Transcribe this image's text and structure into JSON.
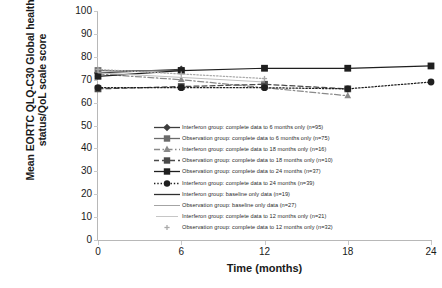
{
  "chart_data": {
    "type": "line",
    "title": "",
    "xlabel": "Time (months)",
    "ylabel": "Mean EORTC QLQ-C30 Global health status/QoL scale score",
    "x": [
      0,
      6,
      12,
      18,
      24
    ],
    "xticks": [
      "0",
      "6",
      "12",
      "18",
      "24"
    ],
    "yticks": [
      "0",
      "10",
      "20",
      "30",
      "40",
      "50",
      "60",
      "70",
      "80",
      "90",
      "100"
    ],
    "xlim": [
      0,
      24
    ],
    "ylim": [
      0,
      100
    ],
    "grid": false,
    "legend_position": "inside-lower-right",
    "series": [
      {
        "name": "Interferon group: complete data to 6 months only (n=95)",
        "marker": "diamond",
        "dash": "solid",
        "color": "#3d3d3d",
        "x": [
          0,
          6
        ],
        "values": [
          73.0,
          74.5
        ]
      },
      {
        "name": "Observation group: complete data to 6 months only (n=75)",
        "marker": "square",
        "dash": "solid",
        "color": "#6b6b6b",
        "x": [
          0,
          6
        ],
        "values": [
          74.0,
          74.0
        ]
      },
      {
        "name": "Interferon group: complete data to 18 months only (n=16)",
        "marker": "triangle",
        "dash": "dashdot",
        "color": "#8a8a8a",
        "x": [
          0,
          6,
          12,
          18
        ],
        "values": [
          72.5,
          70.0,
          66.5,
          63.0
        ]
      },
      {
        "name": "Observation group: complete data to 18 months only (n=10)",
        "marker": "square",
        "dash": "dashed",
        "color": "#4a4a4a",
        "x": [
          0,
          6,
          12,
          18
        ],
        "values": [
          66.0,
          67.0,
          68.0,
          66.0
        ]
      },
      {
        "name": "Observation group: complete data to 24 months (n=37)",
        "marker": "square",
        "dash": "solid",
        "color": "#1f1f1f",
        "x": [
          0,
          6,
          12,
          18,
          24
        ],
        "values": [
          71.5,
          74.0,
          75.0,
          75.0,
          76.0
        ]
      },
      {
        "name": "Interferon group: complete data to 24 months  (n=39)",
        "marker": "circle",
        "dash": "dotted",
        "color": "#1f1f1f",
        "x": [
          0,
          6,
          12,
          18,
          24
        ],
        "values": [
          66.5,
          66.5,
          66.5,
          66.0,
          69.0
        ]
      },
      {
        "name": "Interferon group: baseline only data  (n=19)",
        "marker": "none",
        "dash": "solid",
        "color": "#2f2f2f",
        "x": [
          0
        ],
        "values": [
          73.5
        ]
      },
      {
        "name": "Observation group: baseline only data (n=27)",
        "marker": "none",
        "dash": "solid",
        "color": "#9a9a9a",
        "x": [
          0
        ],
        "values": [
          72.0
        ]
      },
      {
        "name": "Interferon group: complete data to 12 months only (n=21)",
        "marker": "none",
        "dash": "solid",
        "color": "#c0c0c0",
        "x": [
          0,
          6,
          12
        ],
        "values": [
          73.0,
          71.0,
          69.0
        ]
      },
      {
        "name": "Observation group: complete data to 12 months only (n=32)",
        "marker": "cross",
        "dash": "dotted",
        "color": "#aaaaaa",
        "x": [
          0,
          6,
          12
        ],
        "values": [
          74.5,
          72.5,
          70.5
        ]
      }
    ]
  }
}
